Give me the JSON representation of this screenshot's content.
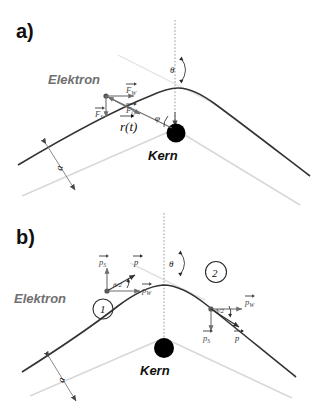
{
  "figure": {
    "panels": [
      {
        "id": "a",
        "label": "a)",
        "labels": {
          "electron": "Elektron",
          "nucleus": "Kern",
          "position_vector": "r(t)",
          "position_vector_symbol": "r",
          "impact_parameter": "a",
          "scattering_angle": "θ",
          "polar_angle": "φ"
        },
        "vectors": [
          {
            "name": "force-tangential",
            "symbol": "F",
            "subscript": "W",
            "direction": "right"
          },
          {
            "name": "force-coulomb",
            "symbol": "F",
            "subscript": "C",
            "direction": "down-right"
          },
          {
            "name": "force-perpendicular",
            "symbol": "F",
            "subscript": "S",
            "direction": "down"
          }
        ]
      },
      {
        "id": "b",
        "label": "b)",
        "labels": {
          "electron": "Elektron",
          "nucleus": "Kern",
          "impact_parameter": "a",
          "scattering_angle": "θ",
          "half_angle": "θ/2",
          "point_one": "1",
          "point_two": "2"
        },
        "vectors": [
          {
            "name": "momentum-perp-1",
            "symbol": "p",
            "subscript": "S",
            "direction": "up"
          },
          {
            "name": "momentum-total-1",
            "symbol": "p",
            "subscript": "",
            "direction": "up-right"
          },
          {
            "name": "momentum-tangential-1",
            "symbol": "p",
            "subscript": "W",
            "direction": "right"
          },
          {
            "name": "momentum-tangential-2",
            "symbol": "p",
            "subscript": "W",
            "direction": "right"
          },
          {
            "name": "momentum-perp-2",
            "symbol": "p",
            "subscript": "S",
            "direction": "down"
          },
          {
            "name": "momentum-total-2",
            "symbol": "p",
            "subscript": "",
            "direction": "down-right"
          }
        ]
      }
    ],
    "colors": {
      "trajectory": "#333333",
      "asymptote": "#d8d8d8",
      "axis": "#9a9a9a",
      "vector_gray": "#6e6e6e",
      "nucleus": "#000000",
      "electron_label": "#6f6f6f"
    }
  }
}
